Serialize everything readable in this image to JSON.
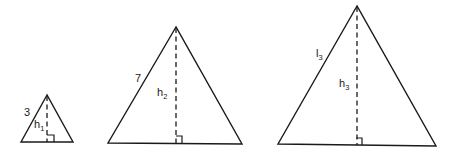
{
  "diagram": {
    "line_color": "#1a1a1a",
    "background": "#ffffff",
    "triangles": [
      {
        "id": "triangle-1",
        "side_label": "3",
        "height_label_main": "h",
        "height_label_sub": "1",
        "right_angle_marker": true
      },
      {
        "id": "triangle-2",
        "side_label": "7",
        "height_label_main": "h",
        "height_label_sub": "2",
        "right_angle_marker": true
      },
      {
        "id": "triangle-3",
        "side_label_main": "l",
        "side_label_sub": "3",
        "height_label_main": "h",
        "height_label_sub": "3",
        "right_angle_marker": true
      }
    ]
  }
}
